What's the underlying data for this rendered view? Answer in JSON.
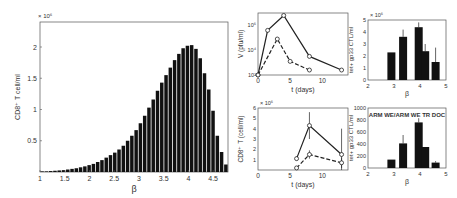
{
  "chart_data": [
    {
      "id": "histogram",
      "type": "bar",
      "title": "",
      "xlabel": "β",
      "ylabel": "CD8⁺ T cell/ml",
      "y_multiplier": "× 10⁶",
      "xlim": [
        1,
        4.8
      ],
      "ylim": [
        0,
        2.4
      ],
      "xticks": [
        "1",
        "1.5",
        "2",
        "2.5",
        "3",
        "3.5",
        "4",
        "4.5"
      ],
      "yticks": [
        "0.5",
        "1",
        "1.5",
        "2"
      ],
      "x": [
        1.05,
        1.15,
        1.25,
        1.35,
        1.45,
        1.55,
        1.65,
        1.75,
        1.85,
        1.95,
        2.05,
        2.15,
        2.25,
        2.35,
        2.45,
        2.55,
        2.65,
        2.75,
        2.85,
        2.95,
        3.05,
        3.15,
        3.25,
        3.35,
        3.45,
        3.55,
        3.65,
        3.75,
        3.85,
        3.95,
        4.05,
        4.15,
        4.25,
        4.35,
        4.45,
        4.55,
        4.65,
        4.75
      ],
      "values": [
        0.01,
        0.01,
        0.015,
        0.02,
        0.025,
        0.03,
        0.04,
        0.05,
        0.06,
        0.075,
        0.09,
        0.11,
        0.13,
        0.16,
        0.19,
        0.23,
        0.27,
        0.31,
        0.36,
        0.42,
        0.5,
        0.58,
        0.67,
        0.78,
        0.9,
        1.03,
        1.16,
        1.3,
        1.43,
        1.55,
        1.67,
        1.79,
        1.89,
        1.98,
        2.02,
        2.03,
        1.97,
        1.82,
        1.58,
        1.32,
        0.98,
        0.58,
        0.32,
        0.12
      ]
    },
    {
      "id": "viral-load",
      "type": "line",
      "xlabel": "t (days)",
      "ylabel": "V (pfu/ml)",
      "yscale": "log",
      "xlim": [
        0,
        14
      ],
      "xticks": [
        "0",
        "5",
        "10"
      ],
      "yticks": [
        "10²",
        "10⁴",
        "10⁶"
      ],
      "series": [
        {
          "name": "solid",
          "style": "solid",
          "x": [
            0,
            1.5,
            4,
            8,
            13
          ],
          "y_log10": [
            2,
            5.6,
            6.8,
            3.5,
            2.4
          ]
        },
        {
          "name": "dashed",
          "style": "dashed",
          "x": [
            0,
            3,
            5,
            8
          ],
          "y_log10": [
            2,
            4.9,
            3.1,
            2.4
          ]
        }
      ]
    },
    {
      "id": "cd8-timecourse",
      "type": "line",
      "xlabel": "t (days)",
      "ylabel": "CD8⁺ T (cell/ml)",
      "y_multiplier": "× 10⁶",
      "xlim": [
        0,
        14
      ],
      "ylim": [
        0,
        6
      ],
      "xticks": [
        "0",
        "5",
        "10"
      ],
      "yticks": [
        "1",
        "2",
        "3",
        "4",
        "5",
        "6"
      ],
      "series": [
        {
          "name": "solid",
          "style": "solid",
          "x": [
            6,
            8,
            13
          ],
          "y": [
            1.1,
            4.3,
            1.5
          ],
          "err": [
            0.2,
            1.3,
            2.5
          ]
        },
        {
          "name": "dashed",
          "style": "dashed",
          "x": [
            6,
            8,
            13
          ],
          "y": [
            0.2,
            1.5,
            0.7
          ],
          "err": [
            0.1,
            0.4,
            0.5
          ]
        }
      ]
    },
    {
      "id": "tet-bar-top",
      "type": "bar",
      "xlabel": "β",
      "ylabel": "tet+ gp33 CTL/ml",
      "y_multiplier": "× 10⁶",
      "xlim": [
        2,
        5
      ],
      "ylim": [
        0,
        5
      ],
      "xticks": [
        "2",
        "3",
        "4",
        "5"
      ],
      "yticks": [
        "0",
        "1",
        "2",
        "3",
        "4",
        "5"
      ],
      "x": [
        2.9,
        3.35,
        3.95,
        4.2,
        4.6
      ],
      "values": [
        2.3,
        3.6,
        4.4,
        2.4,
        1.5
      ],
      "err": [
        0,
        0.6,
        0.4,
        0.6,
        1.2
      ]
    },
    {
      "id": "tet-bar-bottom",
      "type": "bar",
      "title": "ARM WE/ARM WE TR DOC",
      "xlabel": "β",
      "ylabel": "tet+ gp33 CTL/ml",
      "xlim": [
        2,
        5
      ],
      "ylim": [
        0,
        1000
      ],
      "xticks": [
        "2",
        "3",
        "4",
        "5"
      ],
      "yticks": [
        "0",
        "200",
        "400",
        "600",
        "800",
        "1000"
      ],
      "x": [
        2.9,
        3.35,
        3.95,
        4.2,
        4.6
      ],
      "values": [
        140,
        410,
        760,
        350,
        90
      ],
      "err": [
        0,
        140,
        70,
        0,
        25
      ]
    }
  ]
}
